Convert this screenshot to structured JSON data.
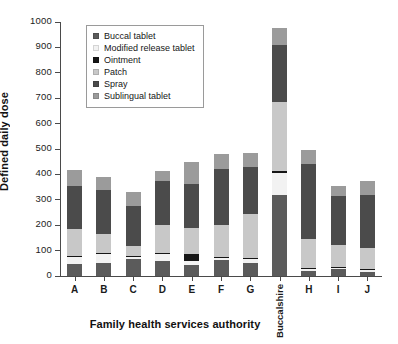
{
  "figure": {
    "background": "#ffffff",
    "axis_color": "#4a4a4a"
  },
  "axes": {
    "ylabel": "Defined daily dose",
    "xlabel": "Family health services authority",
    "yticks": [
      0,
      100,
      200,
      300,
      400,
      500,
      600,
      700,
      800,
      900,
      1000
    ],
    "ylim": [
      0,
      1000
    ],
    "grid": false
  },
  "legend": {
    "position": "upper-left-inside",
    "entries": [
      {
        "label": "Buccal tablet",
        "color": "#5b5b5b"
      },
      {
        "label": "Modified release tablet",
        "color": "#f2f2f2"
      },
      {
        "label": "Ointment",
        "color": "#161616"
      },
      {
        "label": "Patch",
        "color": "#c8c8c8"
      },
      {
        "label": "Spray",
        "color": "#4b4b4b"
      },
      {
        "label": "Sublingual tablet",
        "color": "#9b9b9b"
      }
    ]
  },
  "chart_data": {
    "type": "bar",
    "subtype": "stacked",
    "title": "",
    "xlabel": "Family health services authority",
    "ylabel": "Defined daily dose",
    "ylim": [
      0,
      1000
    ],
    "grid": false,
    "legend_position": "upper-left-inside",
    "categories": [
      "A",
      "B",
      "C",
      "D",
      "E",
      "F",
      "G",
      "Buccalshire",
      "H",
      "I",
      "J"
    ],
    "series": [
      {
        "name": "Buccal tablet",
        "color": "#5b5b5b",
        "values": [
          48,
          50,
          65,
          60,
          45,
          63,
          50,
          320,
          20,
          28,
          16
        ]
      },
      {
        "name": "Modified release tablet",
        "color": "#f2f2f2",
        "values": [
          28,
          38,
          12,
          25,
          13,
          10,
          20,
          85,
          8,
          5,
          8
        ]
      },
      {
        "name": "Ointment",
        "color": "#161616",
        "values": [
          3,
          2,
          2,
          5,
          30,
          2,
          2,
          7,
          2,
          2,
          2
        ]
      },
      {
        "name": "Patch",
        "color": "#c8c8c8",
        "values": [
          106,
          75,
          40,
          112,
          100,
          124,
          173,
          273,
          115,
          88,
          85
        ]
      },
      {
        "name": "Spray",
        "color": "#4b4b4b",
        "values": [
          168,
          175,
          157,
          172,
          175,
          221,
          185,
          225,
          295,
          192,
          208
        ]
      },
      {
        "name": "Sublingual tablet",
        "color": "#9b9b9b",
        "values": [
          64,
          50,
          53,
          41,
          85,
          60,
          53,
          65,
          55,
          38,
          55
        ]
      }
    ],
    "totals": [
      417,
      390,
      329,
      415,
      448,
      480,
      483,
      975,
      495,
      353,
      374
    ]
  }
}
